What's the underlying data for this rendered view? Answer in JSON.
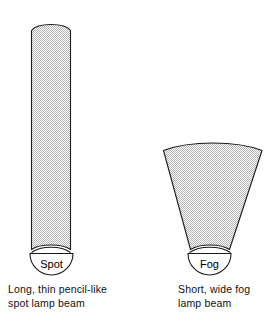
{
  "figure": {
    "background_color": "#ffffff",
    "ink_color": "#000000",
    "beam_fill_color": "#d8d8d8",
    "beam_fill_pattern": "stipple-dot"
  },
  "beams": [
    {
      "id": "spot",
      "lamp_label": "Spot",
      "shape": "long narrow column with rounded top",
      "caption_lines": [
        "Long, thin pencil-like",
        "spot lamp beam"
      ]
    },
    {
      "id": "fog",
      "lamp_label": "Fog",
      "shape": "short wide fan with curved top",
      "caption_lines": [
        "Short, wide fog",
        "lamp beam"
      ]
    }
  ],
  "captions": {
    "spot": {
      "line1": "Long, thin pencil-like",
      "line2": "spot lamp beam"
    },
    "fog": {
      "line1": "Short, wide fog",
      "line2": "lamp beam"
    }
  },
  "labels": {
    "spot": "Spot",
    "fog": "Fog"
  }
}
